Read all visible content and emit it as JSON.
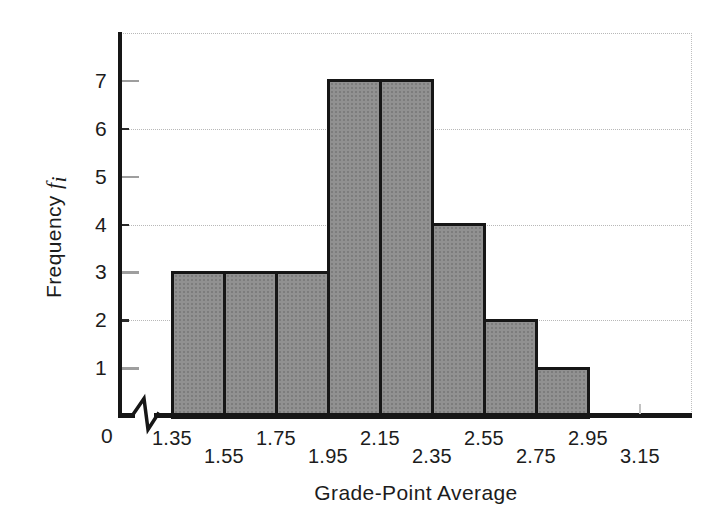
{
  "figure": {
    "x_axis_title": "Grade-Point Average",
    "y_axis_title_word": "Frequency",
    "y_axis_title_var": "f",
    "y_axis_title_sub": "i",
    "origin_label": "0"
  },
  "chart_data": {
    "type": "bar",
    "subtype": "histogram",
    "title": "",
    "xlabel": "Grade-Point Average",
    "ylabel": "Frequency f_i",
    "bin_edges": [
      1.35,
      1.55,
      1.75,
      1.95,
      2.15,
      2.35,
      2.55,
      2.75,
      2.95
    ],
    "bin_width": 0.2,
    "categories": [
      "1.35-1.55",
      "1.55-1.75",
      "1.75-1.95",
      "1.95-2.15",
      "2.15-2.35",
      "2.35-2.55",
      "2.55-2.75",
      "2.75-2.95"
    ],
    "values": [
      3,
      3,
      3,
      7,
      7,
      4,
      2,
      1
    ],
    "x_tick_labels": [
      "1.35",
      "1.55",
      "1.75",
      "1.95",
      "2.15",
      "2.35",
      "2.55",
      "2.75",
      "2.95",
      "3.15"
    ],
    "y_tick_labels": [
      "1",
      "2",
      "3",
      "4",
      "5",
      "6",
      "7"
    ],
    "ylim": [
      0,
      8
    ],
    "xlim": [
      1.35,
      3.35
    ],
    "x_axis_break_before_first_bin": true,
    "x_tick_label_rows": "staggered",
    "grid": "dotted horizontal lines at y = 2, 4, 6, 8; dotted right frame",
    "legend": "none",
    "bar_fill_color": "#919191",
    "bar_border_color": "#161616",
    "axis_color": "#161616",
    "gridline_color": "#b8b8b8",
    "background_color": "#ffffff"
  }
}
